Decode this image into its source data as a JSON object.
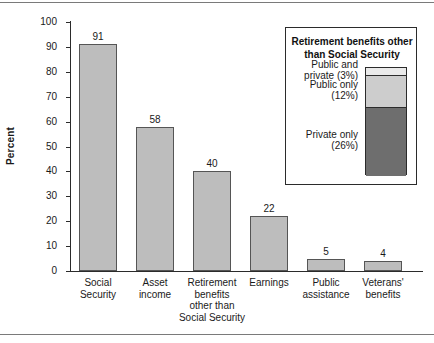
{
  "chart_data": {
    "type": "bar",
    "title": "",
    "xlabel": "",
    "ylabel": "Percent",
    "ylim": [
      0,
      100
    ],
    "ytick_step": 10,
    "grid": false,
    "bar_color": "#bdbdbd",
    "bar_edge_color": "#555555",
    "categories": [
      "Social\nSecurity",
      "Asset\nincome",
      "Retirement\nbenefits\nother than\nSocial Security",
      "Earnings",
      "Public\nassistance",
      "Veterans'\nbenefits"
    ],
    "values": [
      91,
      58,
      40,
      22,
      5,
      4
    ],
    "value_labels": [
      "91",
      "58",
      "40",
      "22",
      "5",
      "4"
    ],
    "yticks": [
      "0",
      "10",
      "20",
      "30",
      "40",
      "50",
      "60",
      "70",
      "80",
      "90",
      "100"
    ]
  },
  "axis": {
    "y_label": "Percent",
    "ticks": [
      "100",
      "90",
      "80",
      "70",
      "60",
      "50",
      "40",
      "30",
      "20",
      "10",
      "0"
    ]
  },
  "bars": [
    {
      "label_lines": [
        "Social",
        "Security"
      ],
      "value": 91,
      "value_label": "91"
    },
    {
      "label_lines": [
        "Asset",
        "income"
      ],
      "value": 58,
      "value_label": "58"
    },
    {
      "label_lines": [
        "Retirement",
        "benefits",
        "other than",
        "Social Security"
      ],
      "value": 40,
      "value_label": "40"
    },
    {
      "label_lines": [
        "Earnings"
      ],
      "value": 22,
      "value_label": "22"
    },
    {
      "label_lines": [
        "Public",
        "assistance"
      ],
      "value": 5,
      "value_label": "5"
    },
    {
      "label_lines": [
        "Veterans'",
        "benefits"
      ],
      "value": 4,
      "value_label": "4"
    }
  ],
  "legend": {
    "title_line1": "Retirement benefits other",
    "title_line2": "than Social Security",
    "items": [
      {
        "label_line1": "Public and",
        "label_line2": "private (3%)",
        "percent": 3,
        "color": "#eaeaea"
      },
      {
        "label_line1": "Public only",
        "label_line2": "(12%)",
        "percent": 12,
        "color": "#cdcdcd"
      },
      {
        "label_line1": "Private only",
        "label_line2": "(26%)",
        "percent": 26,
        "color": "#6e6e6e"
      }
    ]
  }
}
